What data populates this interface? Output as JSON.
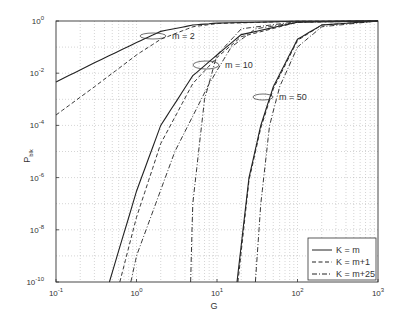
{
  "chart_data": {
    "type": "line",
    "title": "",
    "xlabel": "G",
    "ylabel": "P_blk",
    "xscale": "log",
    "yscale": "log",
    "xlim": [
      0.1,
      1000
    ],
    "ylim": [
      1e-10,
      1
    ],
    "grid": true,
    "x_ticks": [
      "10^-1",
      "10^0",
      "10^1",
      "10^2",
      "10^3"
    ],
    "y_ticks": [
      "10^0",
      "10^-2",
      "10^-4",
      "10^-6",
      "10^-8",
      "10^-10"
    ],
    "legend": {
      "position": "lower right",
      "entries": [
        {
          "label": "K = m",
          "style": "solid"
        },
        {
          "label": "K = m+1",
          "style": "dashed"
        },
        {
          "label": "K = m+25",
          "style": "dashdot"
        }
      ]
    },
    "annotations": [
      {
        "text": "m = 2",
        "x": 2.6,
        "y": 0.35
      },
      {
        "text": "m = 10",
        "x": 11,
        "y": 0.028
      },
      {
        "text": "m = 50",
        "x": 55,
        "y": 0.0012
      }
    ],
    "series": [
      {
        "name": "m=2, K=m",
        "style": "solid",
        "x": [
          0.1,
          0.3,
          1,
          2,
          5,
          10,
          100,
          1000
        ],
        "y": [
          0.0046,
          0.025,
          0.15,
          0.4,
          0.7,
          0.83,
          0.98,
          1.0
        ]
      },
      {
        "name": "m=2, K=m+1",
        "style": "dashed",
        "x": [
          0.1,
          0.3,
          1,
          2,
          5,
          10,
          100,
          1000
        ],
        "y": [
          0.00025,
          0.003,
          0.05,
          0.2,
          0.6,
          0.8,
          0.98,
          1.0
        ]
      },
      {
        "name": "m=2, K=m+25",
        "style": "dashdot",
        "x": [
          4.7,
          5,
          7,
          10,
          20,
          100,
          1000
        ],
        "y": [
          1e-10,
          1e-07,
          0.001,
          0.05,
          0.5,
          0.95,
          1.0
        ]
      },
      {
        "name": "m=10, K=m",
        "style": "solid",
        "x": [
          0.46,
          1,
          2,
          5,
          10,
          20,
          100,
          1000
        ],
        "y": [
          1e-10,
          3e-07,
          0.0001,
          0.008,
          0.05,
          0.3,
          0.9,
          1.0
        ]
      },
      {
        "name": "m=10, K=m+1",
        "style": "dashed",
        "x": [
          0.62,
          1,
          2,
          5,
          10,
          20,
          100,
          1000
        ],
        "y": [
          1e-10,
          3e-08,
          2e-05,
          0.004,
          0.04,
          0.25,
          0.9,
          1.0
        ]
      },
      {
        "name": "m=10, K=m+25",
        "style": "dashdot",
        "x": [
          0.85,
          1,
          3,
          8,
          15,
          30,
          100,
          1000
        ],
        "y": [
          1e-10,
          1e-09,
          1e-05,
          0.004,
          0.1,
          0.5,
          0.9,
          1.0
        ]
      },
      {
        "name": "m=50, K=m",
        "style": "solid",
        "x": [
          17.7,
          25,
          35,
          50,
          100,
          200,
          1000
        ],
        "y": [
          1e-10,
          1e-06,
          0.0001,
          0.003,
          0.2,
          0.7,
          1.0
        ]
      },
      {
        "name": "m=50, K=m+1",
        "style": "dashed",
        "x": [
          18.2,
          25,
          35,
          50,
          100,
          200,
          1000
        ],
        "y": [
          1e-10,
          8e-07,
          8e-05,
          0.0025,
          0.18,
          0.7,
          1.0
        ]
      },
      {
        "name": "m=50, K=m+25",
        "style": "dashdot",
        "x": [
          30,
          35,
          45,
          60,
          100,
          200,
          1000
        ],
        "y": [
          1e-10,
          1e-07,
          0.0001,
          0.003,
          0.1,
          0.6,
          1.0
        ]
      }
    ]
  }
}
